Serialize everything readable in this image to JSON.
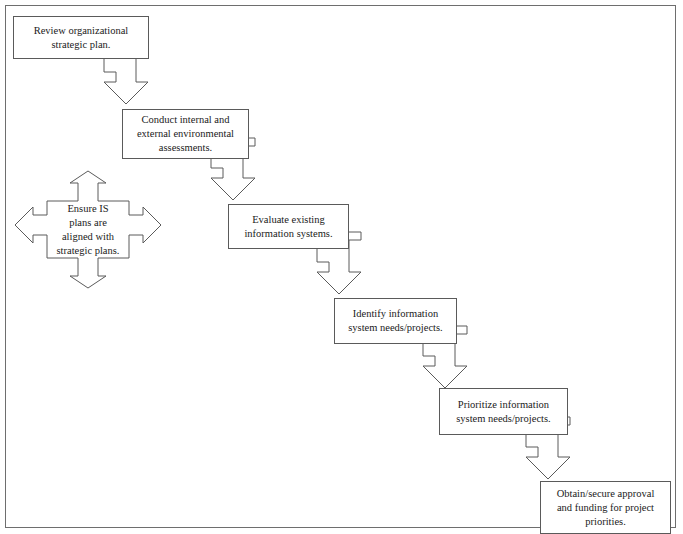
{
  "diagram": {
    "border_color": "#6e6e6e",
    "shape_stroke_color": "#5a5a5a",
    "background_color": "#ffffff",
    "text_color": "#1a1a1a",
    "nodes": [
      {
        "id": "review-strategic-plan",
        "shape": "rectangle",
        "text": "Review organizational\nstrategic plan.",
        "x": 13,
        "y": 16,
        "width": 136,
        "height": 43
      },
      {
        "id": "conduct-assessments",
        "shape": "rectangle",
        "text": "Conduct internal and\nexternal environmental\nassessments.",
        "x": 122,
        "y": 109,
        "width": 127,
        "height": 50
      },
      {
        "id": "evaluate-existing-systems",
        "shape": "rectangle",
        "text": "Evaluate existing\ninformation systems.",
        "x": 228,
        "y": 204,
        "width": 121,
        "height": 45
      },
      {
        "id": "identify-needs",
        "shape": "rectangle",
        "text": "Identify information\nsystem needs/projects.",
        "x": 334,
        "y": 298,
        "width": 123,
        "height": 46
      },
      {
        "id": "prioritize-needs",
        "shape": "rectangle",
        "text": "Prioritize information\nsystem needs/projects.",
        "x": 439,
        "y": 388,
        "width": 129,
        "height": 47
      },
      {
        "id": "obtain-approval-funding",
        "shape": "rectangle",
        "text": "Obtain/secure approval\nand funding for project\npriorities.",
        "x": 540,
        "y": 481,
        "width": 131,
        "height": 53
      },
      {
        "id": "ensure-is-alignment",
        "shape": "four-way-arrow",
        "text": "Ensure IS\nplans are\naligned with\nstrategic plans.",
        "x": 15,
        "y": 171,
        "width": 146,
        "height": 117
      }
    ],
    "connectors": [
      {
        "id": "connector-1",
        "from": "review-strategic-plan",
        "to": "conduct-assessments",
        "shape": "elbow-down-arrow",
        "direction": "down-right"
      },
      {
        "id": "connector-2",
        "from": "conduct-assessments",
        "to": "evaluate-existing-systems",
        "shape": "elbow-down-arrow",
        "direction": "down-right"
      },
      {
        "id": "connector-3",
        "from": "evaluate-existing-systems",
        "to": "identify-needs",
        "shape": "elbow-down-arrow",
        "direction": "down-right"
      },
      {
        "id": "connector-4",
        "from": "identify-needs",
        "to": "prioritize-needs",
        "shape": "elbow-down-arrow",
        "direction": "down-right"
      },
      {
        "id": "connector-5",
        "from": "prioritize-needs",
        "to": "obtain-approval-funding",
        "shape": "elbow-down-arrow",
        "direction": "down-right"
      }
    ]
  }
}
